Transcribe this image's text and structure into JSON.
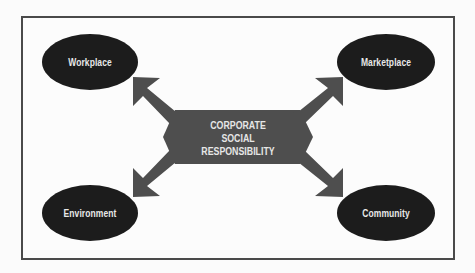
{
  "diagram": {
    "title": "Corporate Social Responsibility",
    "center": {
      "lines": [
        "CORPORATE",
        "SOCIAL",
        "RESPONSIBILITY"
      ]
    },
    "nodes": [
      {
        "id": "workplace",
        "label": "Workplace",
        "position": "top-left"
      },
      {
        "id": "marketplace",
        "label": "Marketplace",
        "position": "top-right"
      },
      {
        "id": "environment",
        "label": "Environment",
        "position": "bottom-left"
      },
      {
        "id": "community",
        "label": "Community",
        "position": "bottom-right"
      }
    ],
    "colors": {
      "ellipse_fill": "#1c1c1c",
      "arrow_fill": "#4e4e4e",
      "frame_border": "#4a4a4a",
      "text": "#e8e8e8",
      "background": "#fcfcfc"
    }
  }
}
